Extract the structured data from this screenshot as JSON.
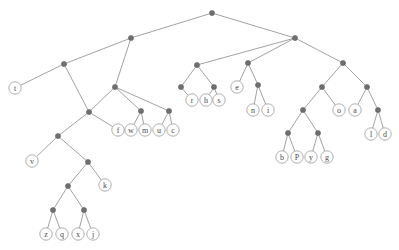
{
  "figure": {
    "name": "binary-tree-diagram",
    "width": 399,
    "height": 250,
    "background_color": "#ffffff",
    "edge_color": "#8a8a8a",
    "internal_node_color": "#6f6f6f",
    "leaf_fill_color": "#ffffff",
    "leaf_stroke_color": "#9a9a9a",
    "label_color": "#4a4a4a"
  },
  "tree": {
    "internal_node_radius": 2.6,
    "leaf_radius": 6.2,
    "nodes": [
      {
        "id": "n0",
        "type": "internal",
        "label": "",
        "x": 212,
        "y": 13
      },
      {
        "id": "n1",
        "type": "internal",
        "label": "",
        "x": 131,
        "y": 38
      },
      {
        "id": "n2",
        "type": "internal",
        "label": "",
        "x": 295,
        "y": 38
      },
      {
        "id": "n3",
        "type": "internal",
        "label": "",
        "x": 64,
        "y": 64
      },
      {
        "id": "n4",
        "type": "internal",
        "label": "",
        "x": 197,
        "y": 65
      },
      {
        "id": "n5",
        "type": "internal",
        "label": "",
        "x": 248,
        "y": 63
      },
      {
        "id": "n6",
        "type": "internal",
        "label": "",
        "x": 343,
        "y": 63
      },
      {
        "id": "l_t",
        "type": "leaf",
        "label": "t",
        "x": 15,
        "y": 88
      },
      {
        "id": "n7",
        "type": "internal",
        "label": "",
        "x": 115,
        "y": 87
      },
      {
        "id": "n8",
        "type": "internal",
        "label": "",
        "x": 181,
        "y": 87
      },
      {
        "id": "n9",
        "type": "internal",
        "label": "",
        "x": 214,
        "y": 87
      },
      {
        "id": "l_e",
        "type": "leaf",
        "label": "e",
        "x": 237,
        "y": 87
      },
      {
        "id": "n10",
        "type": "internal",
        "label": "",
        "x": 258,
        "y": 85
      },
      {
        "id": "n11",
        "type": "internal",
        "label": "",
        "x": 322,
        "y": 87
      },
      {
        "id": "n12",
        "type": "internal",
        "label": "",
        "x": 367,
        "y": 87
      },
      {
        "id": "n13",
        "type": "internal",
        "label": "",
        "x": 89,
        "y": 112
      },
      {
        "id": "n14",
        "type": "internal",
        "label": "",
        "x": 141,
        "y": 111
      },
      {
        "id": "n15",
        "type": "internal",
        "label": "",
        "x": 169,
        "y": 111
      },
      {
        "id": "l_r",
        "type": "leaf",
        "label": "r",
        "x": 192,
        "y": 100
      },
      {
        "id": "l_h",
        "type": "leaf",
        "label": "h",
        "x": 206,
        "y": 100
      },
      {
        "id": "l_s",
        "type": "leaf",
        "label": "s",
        "x": 219,
        "y": 100
      },
      {
        "id": "l_n",
        "type": "leaf",
        "label": "n",
        "x": 253,
        "y": 110
      },
      {
        "id": "l_i",
        "type": "leaf",
        "label": "i",
        "x": 268,
        "y": 110
      },
      {
        "id": "n16",
        "type": "internal",
        "label": "",
        "x": 303,
        "y": 110
      },
      {
        "id": "l_o",
        "type": "leaf",
        "label": "o",
        "x": 339,
        "y": 110
      },
      {
        "id": "l_a",
        "type": "leaf",
        "label": "a",
        "x": 355,
        "y": 110
      },
      {
        "id": "n17",
        "type": "internal",
        "label": "",
        "x": 378,
        "y": 110
      },
      {
        "id": "l_f",
        "type": "leaf",
        "label": "f",
        "x": 118,
        "y": 130
      },
      {
        "id": "l_w",
        "type": "leaf",
        "label": "w",
        "x": 131,
        "y": 130
      },
      {
        "id": "l_m",
        "type": "leaf",
        "label": "m",
        "x": 145,
        "y": 130
      },
      {
        "id": "l_u",
        "type": "leaf",
        "label": "u",
        "x": 159,
        "y": 130
      },
      {
        "id": "l_c",
        "type": "leaf",
        "label": "c",
        "x": 173,
        "y": 130
      },
      {
        "id": "n18",
        "type": "internal",
        "label": "",
        "x": 288,
        "y": 133
      },
      {
        "id": "n19",
        "type": "internal",
        "label": "",
        "x": 318,
        "y": 133
      },
      {
        "id": "l_l",
        "type": "leaf",
        "label": "l",
        "x": 371,
        "y": 134
      },
      {
        "id": "l_d",
        "type": "leaf",
        "label": "d",
        "x": 385,
        "y": 134
      },
      {
        "id": "n20",
        "type": "internal",
        "label": "",
        "x": 58,
        "y": 136
      },
      {
        "id": "l_v",
        "type": "leaf",
        "label": "v",
        "x": 32,
        "y": 161
      },
      {
        "id": "n21",
        "type": "internal",
        "label": "",
        "x": 88,
        "y": 162
      },
      {
        "id": "l_b",
        "type": "leaf",
        "label": "b",
        "x": 282,
        "y": 157
      },
      {
        "id": "l_P",
        "type": "leaf",
        "label": "P",
        "x": 297,
        "y": 157
      },
      {
        "id": "l_y",
        "type": "leaf",
        "label": "y",
        "x": 311,
        "y": 157
      },
      {
        "id": "l_g",
        "type": "leaf",
        "label": "g",
        "x": 327,
        "y": 157
      },
      {
        "id": "n22",
        "type": "internal",
        "label": "",
        "x": 68,
        "y": 186
      },
      {
        "id": "l_k",
        "type": "leaf",
        "label": "k",
        "x": 105,
        "y": 185
      },
      {
        "id": "n23",
        "type": "internal",
        "label": "",
        "x": 53,
        "y": 210
      },
      {
        "id": "n24",
        "type": "internal",
        "label": "",
        "x": 84,
        "y": 210
      },
      {
        "id": "l_z",
        "type": "leaf",
        "label": "z",
        "x": 46,
        "y": 234
      },
      {
        "id": "l_q",
        "type": "leaf",
        "label": "q",
        "x": 62,
        "y": 234
      },
      {
        "id": "l_x",
        "type": "leaf",
        "label": "x",
        "x": 78,
        "y": 234
      },
      {
        "id": "l_j",
        "type": "leaf",
        "label": "j",
        "x": 93,
        "y": 234
      }
    ],
    "edges": [
      [
        "n0",
        "n1"
      ],
      [
        "n0",
        "n2"
      ],
      [
        "n1",
        "n3"
      ],
      [
        "n1",
        "n7"
      ],
      [
        "n2",
        "n4"
      ],
      [
        "n2",
        "n5"
      ],
      [
        "n2",
        "n6"
      ],
      [
        "n3",
        "l_t"
      ],
      [
        "n3",
        "n13"
      ],
      [
        "n4",
        "n8"
      ],
      [
        "n4",
        "n9"
      ],
      [
        "n5",
        "l_e"
      ],
      [
        "n5",
        "n10"
      ],
      [
        "n6",
        "n11"
      ],
      [
        "n6",
        "n12"
      ],
      [
        "n7",
        "n13"
      ],
      [
        "n7",
        "n14"
      ],
      [
        "n8",
        "l_r"
      ],
      [
        "n9",
        "l_h"
      ],
      [
        "n9",
        "l_s"
      ],
      [
        "n10",
        "l_n"
      ],
      [
        "n10",
        "l_i"
      ],
      [
        "n11",
        "n16"
      ],
      [
        "n11",
        "l_o"
      ],
      [
        "n12",
        "l_a"
      ],
      [
        "n12",
        "n17"
      ],
      [
        "n13",
        "n20"
      ],
      [
        "n13",
        "l_f"
      ],
      [
        "n14",
        "l_w"
      ],
      [
        "n14",
        "l_m"
      ],
      [
        "n15",
        "l_u"
      ],
      [
        "n15",
        "l_c"
      ],
      [
        "n7",
        "n15"
      ],
      [
        "n16",
        "n18"
      ],
      [
        "n16",
        "n19"
      ],
      [
        "n17",
        "l_l"
      ],
      [
        "n17",
        "l_d"
      ],
      [
        "n18",
        "l_b"
      ],
      [
        "n18",
        "l_P"
      ],
      [
        "n19",
        "l_y"
      ],
      [
        "n19",
        "l_g"
      ],
      [
        "n20",
        "l_v"
      ],
      [
        "n20",
        "n21"
      ],
      [
        "n21",
        "n22"
      ],
      [
        "n21",
        "l_k"
      ],
      [
        "n22",
        "n23"
      ],
      [
        "n22",
        "n24"
      ],
      [
        "n23",
        "l_z"
      ],
      [
        "n23",
        "l_q"
      ],
      [
        "n24",
        "l_x"
      ],
      [
        "n24",
        "l_j"
      ]
    ]
  }
}
